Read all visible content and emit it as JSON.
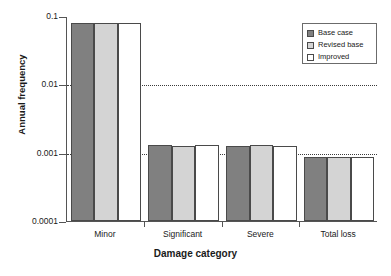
{
  "chart_data": {
    "type": "bar",
    "title": "",
    "xlabel": "Damage category",
    "ylabel": "Annual frequency",
    "yscale": "log",
    "ylim": [
      0.0001,
      0.1
    ],
    "ytick_labels": [
      "0.1",
      "0.01",
      "0.001",
      "0.0001"
    ],
    "ytick_values": [
      0.1,
      0.01,
      0.001,
      0.0001
    ],
    "grid": "horizontal-dotted at 0.01 and 0.001",
    "legend_position": "top-right",
    "categories": [
      "Minor",
      "Significant",
      "Severe",
      "Total loss"
    ],
    "series": [
      {
        "name": "Base case",
        "color": "#808080",
        "values": [
          0.08,
          0.0013,
          0.00125,
          0.00086
        ]
      },
      {
        "name": "Revised base",
        "color": "#d4d4d4",
        "values": [
          0.08,
          0.00125,
          0.0013,
          0.00086
        ]
      },
      {
        "name": "Improved",
        "color": "#ffffff",
        "values": [
          0.08,
          0.00128,
          0.00125,
          0.00086
        ]
      }
    ]
  },
  "legend": {
    "items": [
      {
        "label": "Base case"
      },
      {
        "label": "Revised base"
      },
      {
        "label": "Improved"
      }
    ]
  },
  "axes": {
    "y_title": "Annual frequency",
    "x_title": "Damage category",
    "y_ticks": [
      {
        "label": "0.1"
      },
      {
        "label": "0.01"
      },
      {
        "label": "0.001"
      },
      {
        "label": "0.0001"
      }
    ],
    "x_ticks": [
      {
        "label": "Minor"
      },
      {
        "label": "Significant"
      },
      {
        "label": "Severe"
      },
      {
        "label": "Total loss"
      }
    ]
  }
}
